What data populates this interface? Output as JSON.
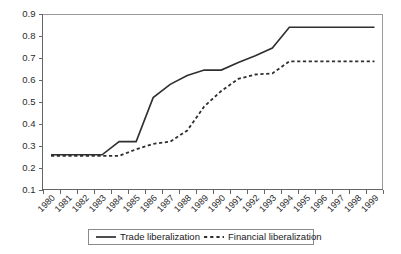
{
  "chart_data": {
    "type": "line",
    "title": "",
    "subtitle": "",
    "xlabel": "",
    "ylabel": "",
    "x": [
      1980,
      1981,
      1982,
      1983,
      1984,
      1985,
      1986,
      1987,
      1988,
      1989,
      1990,
      1991,
      1992,
      1993,
      1994,
      1995,
      1996,
      1997,
      1998,
      1999
    ],
    "categories": [
      "1980",
      "1981",
      "1982",
      "1983",
      "1984",
      "1985",
      "1986",
      "1987",
      "1988",
      "1989",
      "1990",
      "1991",
      "1992",
      "1993",
      "1994",
      "1995",
      "1996",
      "1997",
      "1998",
      "1999"
    ],
    "series": [
      {
        "name": "Trade liberalization",
        "style": "solid",
        "values": [
          0.26,
          0.26,
          0.26,
          0.26,
          0.32,
          0.32,
          0.52,
          0.58,
          0.62,
          0.645,
          0.645,
          0.68,
          0.71,
          0.745,
          0.84,
          0.84,
          0.84,
          0.84,
          0.84,
          0.84
        ]
      },
      {
        "name": "Financial liberalization",
        "style": "dashed",
        "values": [
          0.255,
          0.255,
          0.255,
          0.255,
          0.255,
          0.285,
          0.31,
          0.32,
          0.37,
          0.48,
          0.55,
          0.605,
          0.625,
          0.63,
          0.685,
          0.685,
          0.685,
          0.685,
          0.685,
          0.685
        ]
      }
    ],
    "ylim": [
      0.1,
      0.9
    ],
    "yticks": [
      0.1,
      0.2,
      0.3,
      0.4,
      0.5,
      0.6,
      0.7,
      0.8,
      0.9
    ],
    "ytick_labels": [
      "0.1",
      "0.2",
      "0.3",
      "0.4",
      "0.5",
      "0.6",
      "0.7",
      "0.8",
      "0.9"
    ],
    "grid": false,
    "legend_position": "bottom",
    "line_color": "#2f2f2f",
    "axis_color": "#666666"
  },
  "legend": {
    "entries": [
      {
        "label": "Trade liberalization",
        "style": "solid"
      },
      {
        "label": "Financial liberalization",
        "style": "dashed"
      }
    ]
  }
}
